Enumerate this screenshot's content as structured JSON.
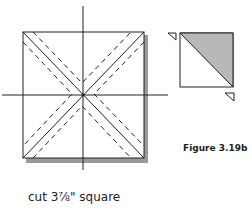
{
  "figure": {
    "label": "Figure 3.19b",
    "caption": "cut 3⅞\" square"
  },
  "colors": {
    "line": "#222222",
    "shadow": "#9a9a9a",
    "shaded_triangle": "#b8b8b8"
  }
}
